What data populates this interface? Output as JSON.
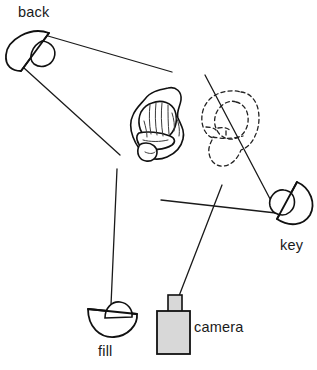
{
  "diagram": {
    "type": "lighting-plan",
    "background_color": "#ffffff",
    "line_color": "#1a1a1a",
    "camera_body_color": "#d8d8d8",
    "labels": {
      "back": "back",
      "key": "key",
      "fill": "fill",
      "camera": "camera"
    },
    "elements": [
      {
        "id": "back-light",
        "label": "back",
        "kind": "half-disc-lamp",
        "x": 26,
        "y": 50,
        "beam_rays": 2
      },
      {
        "id": "key-light",
        "label": "key",
        "kind": "half-disc-lamp",
        "x": 288,
        "y": 205,
        "beam_rays": 1
      },
      {
        "id": "fill-light",
        "label": "fill",
        "kind": "half-disc-lamp",
        "x": 113,
        "y": 318,
        "beam_rays": 1
      },
      {
        "id": "camera",
        "label": "camera",
        "kind": "camera-body",
        "x": 172,
        "y": 325
      },
      {
        "id": "subject-head",
        "label": "",
        "kind": "head-top-view",
        "x": 158,
        "y": 125
      },
      {
        "id": "shadow-head",
        "label": "",
        "kind": "dashed-ghost-head",
        "x": 238,
        "y": 128
      }
    ]
  }
}
